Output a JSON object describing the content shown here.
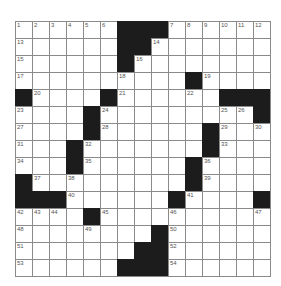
{
  "puzzle": {
    "rows": 15,
    "cols": 15,
    "grid": [
      [
        "1",
        "2",
        "3",
        "4",
        "5",
        "6",
        "#",
        "#",
        "#",
        "7",
        "8",
        "9",
        "10",
        "11",
        "12"
      ],
      [
        "13",
        ".",
        ".",
        ".",
        ".",
        ".",
        "#",
        "#",
        "14",
        ".",
        ".",
        ".",
        ".",
        ".",
        "."
      ],
      [
        "15",
        ".",
        ".",
        ".",
        ".",
        ".",
        "#",
        "16",
        ".",
        ".",
        ".",
        ".",
        ".",
        ".",
        "."
      ],
      [
        "17",
        ".",
        ".",
        ".",
        ".",
        ".",
        "18",
        ".",
        ".",
        ".",
        "#",
        "19",
        ".",
        ".",
        "."
      ],
      [
        "#",
        "20",
        ".",
        ".",
        ".",
        "#",
        "21",
        ".",
        ".",
        ".",
        "22",
        ".",
        "#",
        "#",
        "#"
      ],
      [
        "23",
        ".",
        ".",
        ".",
        "#",
        "24",
        ".",
        ".",
        ".",
        ".",
        ".",
        ".",
        "25",
        "26",
        "#"
      ],
      [
        "27",
        ".",
        ".",
        ".",
        "#",
        "28",
        ".",
        ".",
        ".",
        ".",
        ".",
        "#",
        "29",
        ".",
        "30"
      ],
      [
        "31",
        ".",
        ".",
        "#",
        "32",
        ".",
        ".",
        ".",
        ".",
        ".",
        ".",
        "#",
        "33",
        ".",
        "."
      ],
      [
        "34",
        ".",
        ".",
        "#",
        "35",
        ".",
        ".",
        ".",
        ".",
        ".",
        "#",
        "36",
        ".",
        ".",
        "."
      ],
      [
        "#",
        "37",
        ".",
        "38",
        ".",
        ".",
        ".",
        ".",
        ".",
        ".",
        "#",
        "39",
        ".",
        ".",
        "."
      ],
      [
        "#",
        "#",
        "#",
        "40",
        ".",
        ".",
        ".",
        ".",
        ".",
        "#",
        "41",
        ".",
        ".",
        ".",
        "#"
      ],
      [
        "42",
        "43",
        "44",
        ".",
        "#",
        "45",
        ".",
        ".",
        ".",
        "46",
        ".",
        ".",
        ".",
        ".",
        "47"
      ],
      [
        "48",
        ".",
        ".",
        ".",
        "49",
        ".",
        ".",
        ".",
        "#",
        "50",
        ".",
        ".",
        ".",
        ".",
        "."
      ],
      [
        "51",
        ".",
        ".",
        ".",
        ".",
        ".",
        ".",
        "#",
        "#",
        "52",
        ".",
        ".",
        ".",
        ".",
        "."
      ],
      [
        "53",
        ".",
        ".",
        ".",
        ".",
        ".",
        "#",
        "#",
        "#",
        "54",
        ".",
        ".",
        ".",
        ".",
        "."
      ]
    ]
  },
  "colors": {
    "black_cell": "#1c1c1c",
    "grid_line": "#8a8a8a",
    "number": "#555555"
  }
}
